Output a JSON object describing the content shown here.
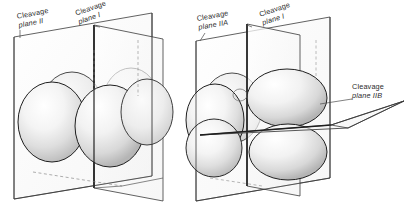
{
  "figure": {
    "background_color": "#ffffff",
    "ink_color": "#1a1a1a",
    "shade_color": "#cfcfcf",
    "panels": [
      {
        "id": "left",
        "name": "four-cell-stage-vertical-cleavage",
        "labels": [
          {
            "name": "label-cleavage-plane-II",
            "line1": "Cleavage",
            "line2": "plane II"
          },
          {
            "name": "label-cleavage-plane-I",
            "line1": "Cleavage",
            "line2": "plane I"
          }
        ],
        "planes": [
          "Cleavage plane II",
          "Cleavage plane I"
        ],
        "cell_count": 4
      },
      {
        "id": "right",
        "name": "eight-cell-stage-horizontal-cleavage",
        "labels": [
          {
            "name": "label-cleavage-plane-IIA",
            "line1": "Cleavage",
            "line2": "plane IIA"
          },
          {
            "name": "label-cleavage-plane-I",
            "line1": "Cleavage",
            "line2": "plane I"
          },
          {
            "name": "label-cleavage-plane-IIB",
            "line1": "Cleavage",
            "line2": "plane IIB"
          }
        ],
        "planes": [
          "Cleavage plane IIA",
          "Cleavage plane I",
          "Cleavage plane IIB"
        ],
        "cell_count": 4
      }
    ]
  }
}
